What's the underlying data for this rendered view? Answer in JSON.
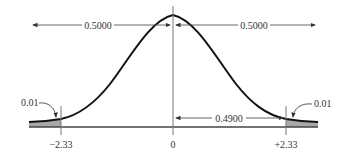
{
  "diagram": {
    "type": "normal-distribution",
    "top_arrows": {
      "left_label": "0.5000",
      "right_label": "0.5000"
    },
    "inner_arrow": {
      "label": "0.4900"
    },
    "tails": {
      "left_label": "0.01",
      "right_label": "0.01"
    },
    "axis": {
      "ticks": [
        {
          "value": -2.33,
          "label": "−2.33"
        },
        {
          "value": 0,
          "label": "0"
        },
        {
          "value": 2.33,
          "label": "+2.33"
        }
      ]
    },
    "colors": {
      "curve": "#111111",
      "shade": "#a8a8a8",
      "lines": "#555555",
      "text": "#333333"
    }
  }
}
